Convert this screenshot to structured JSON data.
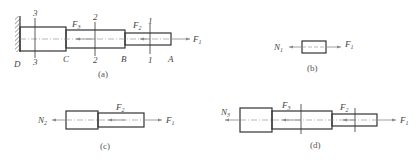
{
  "figure": {
    "panels": [
      {
        "id": "a",
        "caption": "(a)",
        "points": [
          "D",
          "C",
          "B",
          "A"
        ],
        "sections": [
          "3",
          "2",
          "1"
        ],
        "forces": [
          {
            "label": "F",
            "sub": "3"
          },
          {
            "label": "F",
            "sub": "2"
          },
          {
            "label": "F",
            "sub": "1"
          }
        ]
      },
      {
        "id": "b",
        "caption": "(b)",
        "forces": [
          {
            "label": "N",
            "sub": "1"
          },
          {
            "label": "F",
            "sub": "1"
          }
        ]
      },
      {
        "id": "c",
        "caption": "(c)",
        "forces": [
          {
            "label": "N",
            "sub": "2"
          },
          {
            "label": "F",
            "sub": "2"
          },
          {
            "label": "F",
            "sub": "1"
          }
        ]
      },
      {
        "id": "d",
        "caption": "(d)",
        "forces": [
          {
            "label": "N",
            "sub": "3"
          },
          {
            "label": "F",
            "sub": "3"
          },
          {
            "label": "F",
            "sub": "2"
          },
          {
            "label": "F",
            "sub": "1"
          }
        ]
      }
    ]
  }
}
